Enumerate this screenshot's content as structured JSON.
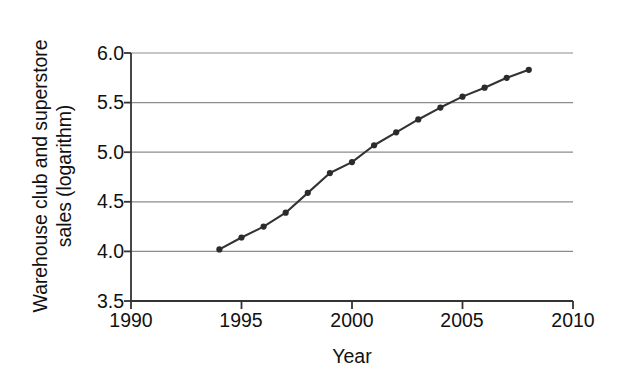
{
  "chart_data": {
    "type": "line",
    "title": "",
    "subtitle": "",
    "xlabel": "Year",
    "ylabel": "Warehouse club and superstore sales (logarithm)",
    "ylabel_lines": [
      "Warehouse club and superstore",
      "sales (logarithm)"
    ],
    "xlim": [
      1990,
      2010
    ],
    "ylim": [
      3.5,
      6.0
    ],
    "xticks": [
      1990,
      1995,
      2000,
      2005,
      2010
    ],
    "xtick_labels": [
      "1990",
      "1995",
      "2000",
      "2005",
      "2010"
    ],
    "yticks": [
      3.5,
      4.0,
      4.5,
      5.0,
      5.5,
      6.0
    ],
    "ytick_labels": [
      "3.5",
      "4.0",
      "4.5",
      "5.0",
      "5.5",
      "6.0"
    ],
    "grid": "horizontal",
    "legend": "none",
    "marker": "filled-circle",
    "line_color": "#333333",
    "marker_color": "#2b2b2b",
    "grid_color": "#8c8c8c",
    "axis_color": "#333333",
    "x": [
      1994,
      1995,
      1996,
      1997,
      1998,
      1999,
      2000,
      2001,
      2002,
      2003,
      2004,
      2005,
      2006,
      2007,
      2008
    ],
    "values": [
      4.02,
      4.14,
      4.25,
      4.39,
      4.59,
      4.79,
      4.9,
      5.07,
      5.2,
      5.33,
      5.45,
      5.56,
      5.65,
      5.75,
      5.83
    ],
    "series": [
      {
        "name": "Warehouse club and superstore sales (logarithm)",
        "values": [
          4.02,
          4.14,
          4.25,
          4.39,
          4.59,
          4.79,
          4.9,
          5.07,
          5.2,
          5.33,
          5.45,
          5.56,
          5.65,
          5.75,
          5.83
        ]
      }
    ],
    "annotations": []
  }
}
